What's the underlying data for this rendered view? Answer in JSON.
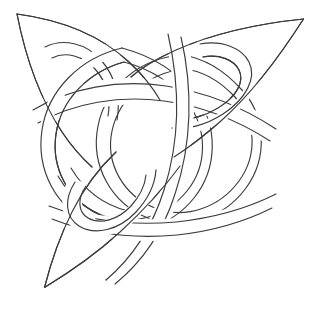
{
  "document": {
    "title": "Celtic Knot Line Drawing",
    "kind": "line-art",
    "subject": "celtic-triquetra-knot",
    "canvas": {
      "width": 312,
      "height": 311
    },
    "background_color": "#ffffff",
    "stroke_color": "#3c3c3c",
    "stroke_width": 1.15,
    "fill": "none"
  },
  "artwork": {
    "name": "celtic-knot",
    "description": "Three-armed interlaced Celtic knot with pointed petal tips and woven bands",
    "tips": [
      {
        "name": "top-left-tip",
        "x": 17,
        "y": 14
      },
      {
        "name": "top-right-tip",
        "x": 303,
        "y": 19
      },
      {
        "name": "bottom-left-tip",
        "x": 44,
        "y": 287
      }
    ],
    "bands": [
      {
        "name": "outer-petal-top-left",
        "d": "M17,14 C74,22 118,48 140,82 C118,110 92,128 62,138 C44,112 30,68 17,14 Z"
      },
      {
        "name": "outer-petal-top-right",
        "d": "M303,19 C262,76 226,112 186,134 C166,116 153,94 148,72 C190,48 244,28 303,19 Z"
      },
      {
        "name": "outer-petal-bottom-left",
        "d": "M44,287 C58,232 78,186 104,156 C128,170 148,186 160,206 C128,240 90,268 44,287 Z"
      },
      {
        "name": "ring-left-large",
        "d": "M150,72 C104,58 62,84 52,128 C42,172 68,216 112,228 C156,240 198,214 208,170 C218,126 194,84 150,72 Z"
      },
      {
        "name": "ring-right-large",
        "d": "M196,60 C150,50 110,78 102,122 C94,166 122,208 166,218 C210,228 250,200 258,156 C266,112 240,70 196,60 Z"
      },
      {
        "name": "loop-top-left-oval",
        "d": "M48,50 C76,36 108,50 120,78 C132,106 120,138 94,150"
      },
      {
        "name": "loop-top-right-oval",
        "d": "M232,52 C258,66 262,96 240,118 C218,140 182,138 164,116"
      },
      {
        "name": "loop-bottom-left-oval",
        "d": "M70,196 C62,226 84,248 114,246 C144,244 166,218 162,190"
      },
      {
        "name": "strand-horizontal-upper",
        "d": "M38,112 C92,84 160,82 214,106 C248,120 276,136 300,150"
      },
      {
        "name": "strand-diagonal-right",
        "d": "M172,40 C186,92 186,150 166,206 C156,236 138,262 112,282"
      },
      {
        "name": "strand-diagonal-left",
        "d": "M60,58 C96,100 126,146 146,196 C158,226 166,254 170,280"
      },
      {
        "name": "strand-lower-sweep",
        "d": "M44,230 C86,214 138,200 192,196 C232,194 268,196 296,200"
      }
    ],
    "crossings": [
      {
        "name": "crossing-upper-left",
        "x": 96,
        "y": 92,
        "over": "strand-horizontal-upper"
      },
      {
        "name": "crossing-upper-center",
        "x": 140,
        "y": 96,
        "over": "ring-left-large"
      },
      {
        "name": "crossing-upper-right",
        "x": 192,
        "y": 98,
        "over": "strand-diagonal-right"
      },
      {
        "name": "crossing-center",
        "x": 146,
        "y": 140,
        "over": "ring-right-large"
      },
      {
        "name": "crossing-lower-left",
        "x": 100,
        "y": 168,
        "over": "strand-diagonal-left"
      },
      {
        "name": "crossing-lower-center",
        "x": 148,
        "y": 196,
        "over": "loop-bottom-left-oval"
      },
      {
        "name": "crossing-lower-right",
        "x": 196,
        "y": 160,
        "over": "ring-right-large"
      },
      {
        "name": "crossing-left-arm",
        "x": 66,
        "y": 128,
        "over": "ring-left-large"
      },
      {
        "name": "crossing-right-arm",
        "x": 230,
        "y": 120,
        "over": "loop-top-right-oval"
      }
    ]
  }
}
